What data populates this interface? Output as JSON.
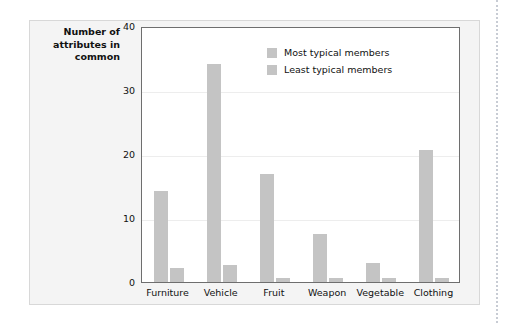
{
  "figure": {
    "y_axis_title": "Number of attributes in common"
  },
  "legend": {
    "items": [
      {
        "label": "Most typical members",
        "color": "#c4c4c4",
        "swatch": "legend-swatch-most-typical"
      },
      {
        "label": "Least typical members",
        "color": "#c4c4c4",
        "swatch": "legend-swatch-least-typical"
      }
    ]
  },
  "chart_data": {
    "type": "bar",
    "title": "",
    "xlabel": "",
    "ylabel": "Number of attributes in common",
    "ylim": [
      0,
      40
    ],
    "yticks": [
      "0",
      "10",
      "20",
      "30",
      "40"
    ],
    "grid": true,
    "legend_position": "top-right",
    "categories": [
      "Furniture",
      "Vehicle",
      "Fruit",
      "Weapon",
      "Vegetable",
      "Clothing"
    ],
    "series": [
      {
        "name": "Most typical members",
        "color": "#c4c4c4",
        "values": [
          14.2,
          34.0,
          16.8,
          7.5,
          3.0,
          20.6
        ]
      },
      {
        "name": "Least typical members",
        "color": "#c4c4c4",
        "values": [
          2.2,
          2.7,
          0.6,
          0.6,
          0.6,
          0.7
        ]
      }
    ]
  }
}
